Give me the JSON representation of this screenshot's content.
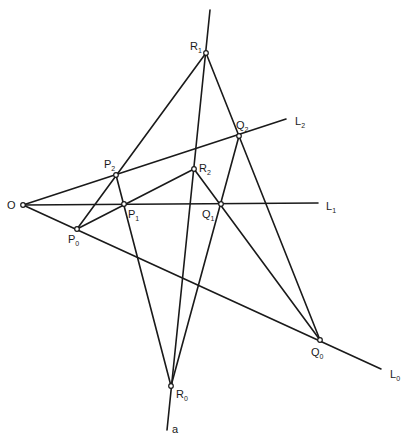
{
  "diagram": {
    "stroke_color": "#1a1a1a",
    "background": "#ffffff",
    "points": [
      {
        "id": "O",
        "label": "O",
        "sub": "",
        "x": 23,
        "y": 205,
        "lx": 7,
        "ly": 209
      },
      {
        "id": "P0",
        "label": "P",
        "sub": "0",
        "x": 77,
        "y": 229,
        "lx": 68,
        "ly": 243
      },
      {
        "id": "P1",
        "label": "P",
        "sub": "1",
        "x": 124,
        "y": 204,
        "lx": 128,
        "ly": 218
      },
      {
        "id": "P2",
        "label": "P",
        "sub": "2",
        "x": 116,
        "y": 175,
        "lx": 104,
        "ly": 168
      },
      {
        "id": "Q0",
        "label": "Q",
        "sub": "0",
        "x": 320,
        "y": 340,
        "lx": 311,
        "ly": 356
      },
      {
        "id": "Q1",
        "label": "Q",
        "sub": "1",
        "x": 221,
        "y": 204,
        "lx": 202,
        "ly": 218
      },
      {
        "id": "Q2",
        "label": "Q",
        "sub": "2",
        "x": 239,
        "y": 136,
        "lx": 236,
        "ly": 129
      },
      {
        "id": "R0",
        "label": "R",
        "sub": "0",
        "x": 171,
        "y": 386,
        "lx": 176,
        "ly": 398
      },
      {
        "id": "R1",
        "label": "R",
        "sub": "1",
        "x": 206,
        "y": 53,
        "lx": 190,
        "ly": 50
      },
      {
        "id": "R2",
        "label": "R",
        "sub": "2",
        "x": 194,
        "y": 169,
        "lx": 199,
        "ly": 172
      }
    ],
    "lines": [
      {
        "id": "L0",
        "label": "L",
        "sub": "0",
        "x1": 23,
        "y1": 205,
        "x2": 381,
        "y2": 369,
        "lx": 390,
        "ly": 378
      },
      {
        "id": "L1",
        "label": "L",
        "sub": "1",
        "x1": 23,
        "y1": 205,
        "x2": 318,
        "y2": 203,
        "lx": 326,
        "ly": 210
      },
      {
        "id": "L2",
        "label": "L",
        "sub": "2",
        "x1": 23,
        "y1": 205,
        "x2": 286,
        "y2": 119,
        "lx": 295,
        "ly": 125
      },
      {
        "id": "a",
        "label": "a",
        "sub": "",
        "x1": 210,
        "y1": 10,
        "x2": 167,
        "y2": 430,
        "lx": 172,
        "ly": 433
      }
    ],
    "segments": [
      {
        "from": "R1",
        "to": "P0"
      },
      {
        "from": "R1",
        "to": "Q0"
      },
      {
        "from": "P2",
        "to": "R0"
      },
      {
        "from": "Q2",
        "to": "R0"
      },
      {
        "from": "P0",
        "to": "R2"
      },
      {
        "from": "R2",
        "to": "Q0"
      }
    ]
  }
}
